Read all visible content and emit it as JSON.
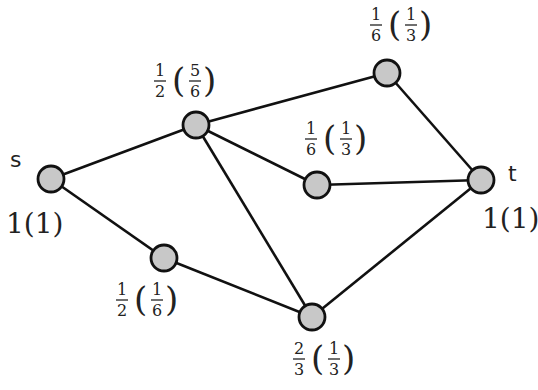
{
  "diagram": {
    "type": "flow-network",
    "nodes": [
      {
        "id": "s",
        "name": "s",
        "x": 51,
        "y": 179,
        "label": "1(1)",
        "label_pos": "below-left",
        "frac": null
      },
      {
        "id": "a",
        "name": "",
        "x": 196,
        "y": 125,
        "frac": {
          "num": "1",
          "den": "2"
        },
        "paren": {
          "num": "5",
          "den": "6"
        },
        "lx": 150,
        "ly": 60
      },
      {
        "id": "b",
        "name": "",
        "x": 387,
        "y": 73,
        "frac": {
          "num": "1",
          "den": "6"
        },
        "paren": {
          "num": "1",
          "den": "3"
        },
        "lx": 370,
        "ly": 3
      },
      {
        "id": "c",
        "name": "",
        "x": 317,
        "y": 185,
        "frac": {
          "num": "1",
          "den": "6"
        },
        "paren": {
          "num": "1",
          "den": "3"
        },
        "lx": 303,
        "ly": 116
      },
      {
        "id": "t",
        "name": "t",
        "x": 481,
        "y": 180,
        "label": "1(1)",
        "label_pos": "below",
        "frac": null
      },
      {
        "id": "d",
        "name": "",
        "x": 164,
        "y": 258,
        "frac": {
          "num": "1",
          "den": "2"
        },
        "paren": {
          "num": "1",
          "den": "6"
        },
        "lx": 115,
        "ly": 280
      },
      {
        "id": "e",
        "name": "",
        "x": 312,
        "y": 317,
        "frac": {
          "num": "2",
          "den": "3"
        },
        "paren": {
          "num": "1",
          "den": "3"
        },
        "lx": 292,
        "ly": 338
      }
    ],
    "edges": [
      [
        "s",
        "a"
      ],
      [
        "s",
        "d"
      ],
      [
        "a",
        "b"
      ],
      [
        "a",
        "c"
      ],
      [
        "a",
        "e"
      ],
      [
        "b",
        "t"
      ],
      [
        "c",
        "t"
      ],
      [
        "d",
        "e"
      ],
      [
        "e",
        "t"
      ]
    ],
    "texts": {
      "s_name": "s",
      "t_name": "t",
      "s_value": "1(1)",
      "t_value": "1(1)",
      "a_num": "1",
      "a_den": "2",
      "a_pnum": "5",
      "a_pden": "6",
      "b_num": "1",
      "b_den": "6",
      "b_pnum": "1",
      "b_pden": "3",
      "c_num": "1",
      "c_den": "6",
      "c_pnum": "1",
      "c_pden": "3",
      "d_num": "1",
      "d_den": "2",
      "d_pnum": "1",
      "d_pden": "6",
      "e_num": "2",
      "e_den": "3",
      "e_pnum": "1",
      "e_pden": "3",
      "lparen": "(",
      "rparen": ")"
    },
    "colors": {
      "node_fill": "#c8c8c8",
      "stroke": "#111111",
      "text": "#222222"
    }
  }
}
